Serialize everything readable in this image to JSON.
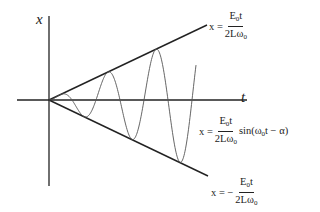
{
  "diagram": {
    "axes": {
      "vertical_label": "x",
      "horizontal_label": "t"
    },
    "equations": {
      "upper_envelope": {
        "lhs": "x =",
        "numerator_base": "E",
        "numerator_sub": "0",
        "numerator_tail": "t",
        "denominator_base": "2Lω",
        "denominator_sub": "0"
      },
      "wave": {
        "lhs": "x =",
        "numerator_base": "E",
        "numerator_sub": "0",
        "numerator_tail": "t",
        "denominator_base": "2Lω",
        "denominator_sub": "0",
        "tail_pre": "sin(ω",
        "tail_sub": "0",
        "tail_post": "t − α)"
      },
      "lower_envelope": {
        "lhs": "x = −",
        "numerator_base": "E",
        "numerator_sub": "0",
        "numerator_tail": "t",
        "denominator_base": "2Lω",
        "denominator_sub": "0"
      }
    },
    "colors": {
      "line": "#222222",
      "wave": "#555555",
      "background": "#ffffff"
    }
  }
}
